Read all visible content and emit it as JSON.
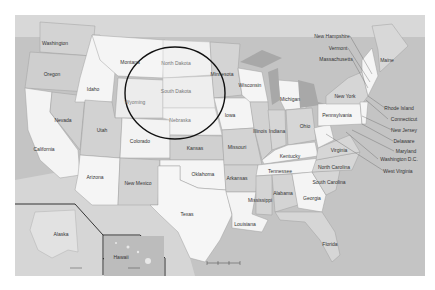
{
  "map": {
    "title": "United States map",
    "colors": {
      "ocean": "#bdbdbd",
      "land_light": "#f4f4f4",
      "land_mid": "#dcdcdc",
      "land_dark": "#c8c8c8",
      "lake": "#a8a8a8",
      "border": "#9a9a9a",
      "circle": "#111111",
      "inset_border": "#222222"
    },
    "highlight_circle": {
      "cx": 175,
      "cy": 93,
      "rx": 50,
      "ry": 46,
      "label": "Dakotas region highlight"
    },
    "states": [
      {
        "name": "Washington",
        "x": 55,
        "y": 43
      },
      {
        "name": "Oregon",
        "x": 52,
        "y": 74
      },
      {
        "name": "California",
        "x": 44,
        "y": 149
      },
      {
        "name": "Nevada",
        "x": 63,
        "y": 120
      },
      {
        "name": "Idaho",
        "x": 93,
        "y": 89
      },
      {
        "name": "Montana",
        "x": 130,
        "y": 62
      },
      {
        "name": "Wyoming",
        "x": 135,
        "y": 102,
        "faint": true
      },
      {
        "name": "Utah",
        "x": 102,
        "y": 130
      },
      {
        "name": "Arizona",
        "x": 95,
        "y": 177
      },
      {
        "name": "Colorado",
        "x": 140,
        "y": 141
      },
      {
        "name": "New Mexico",
        "x": 138,
        "y": 183
      },
      {
        "name": "North Dakota",
        "x": 176,
        "y": 63,
        "faint": true
      },
      {
        "name": "South Dakota",
        "x": 176,
        "y": 91,
        "faint": true
      },
      {
        "name": "Nebraska",
        "x": 180,
        "y": 120,
        "faint": true
      },
      {
        "name": "Kansas",
        "x": 195,
        "y": 148
      },
      {
        "name": "Oklahoma",
        "x": 203,
        "y": 174
      },
      {
        "name": "Texas",
        "x": 187,
        "y": 214
      },
      {
        "name": "Minnesota",
        "x": 222,
        "y": 74
      },
      {
        "name": "Iowa",
        "x": 230,
        "y": 115
      },
      {
        "name": "Missouri",
        "x": 237,
        "y": 147
      },
      {
        "name": "Arkansas",
        "x": 237,
        "y": 178
      },
      {
        "name": "Louisiana",
        "x": 245,
        "y": 224
      },
      {
        "name": "Wisconsin",
        "x": 250,
        "y": 85
      },
      {
        "name": "Illinois",
        "x": 260,
        "y": 131
      },
      {
        "name": "Michigan",
        "x": 290,
        "y": 99
      },
      {
        "name": "Indiana",
        "x": 277,
        "y": 131
      },
      {
        "name": "Ohio",
        "x": 305,
        "y": 126
      },
      {
        "name": "Kentucky",
        "x": 290,
        "y": 156
      },
      {
        "name": "Tennessee",
        "x": 280,
        "y": 171
      },
      {
        "name": "Mississippi",
        "x": 260,
        "y": 200
      },
      {
        "name": "Alabama",
        "x": 283,
        "y": 193
      },
      {
        "name": "Georgia",
        "x": 312,
        "y": 198
      },
      {
        "name": "Florida",
        "x": 330,
        "y": 244
      },
      {
        "name": "South Carolina",
        "x": 329,
        "y": 182,
        "multiline": true
      },
      {
        "name": "North Carolina",
        "x": 334,
        "y": 167
      },
      {
        "name": "Virginia",
        "x": 339,
        "y": 150
      },
      {
        "name": "West Virginia",
        "x": 398,
        "y": 171
      },
      {
        "name": "Washington D.C.",
        "x": 399,
        "y": 159
      },
      {
        "name": "Maryland",
        "x": 406,
        "y": 151
      },
      {
        "name": "Delaware",
        "x": 404,
        "y": 141
      },
      {
        "name": "New Jersey",
        "x": 404,
        "y": 130
      },
      {
        "name": "Connecticut",
        "x": 404,
        "y": 119
      },
      {
        "name": "Rhode Island",
        "x": 399,
        "y": 108
      },
      {
        "name": "Pennsylvania",
        "x": 337,
        "y": 115
      },
      {
        "name": "New York",
        "x": 345,
        "y": 96
      },
      {
        "name": "Massachusetts",
        "x": 336,
        "y": 59
      },
      {
        "name": "Vermont",
        "x": 338,
        "y": 48
      },
      {
        "name": "New Hampshire",
        "x": 332,
        "y": 36
      },
      {
        "name": "Maine",
        "x": 387,
        "y": 60
      },
      {
        "name": "Alaska",
        "x": 61,
        "y": 234
      },
      {
        "name": "Hawaii",
        "x": 121,
        "y": 257
      }
    ],
    "scale_bar": {
      "x": 207,
      "y": 262,
      "ticks": [
        "0",
        "250",
        "500 mi"
      ]
    }
  }
}
